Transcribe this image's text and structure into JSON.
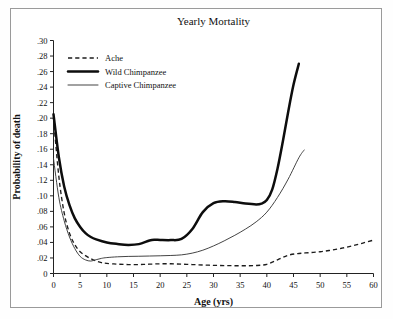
{
  "figure": {
    "title": "Yearly Mortality",
    "frame_color": "#9a9a9a",
    "background": "#ffffff"
  },
  "chart_data": {
    "type": "line",
    "title": "Yearly Mortality",
    "xlabel": "Age (yrs)",
    "ylabel": "Probability of death",
    "xlim": [
      0,
      60
    ],
    "ylim": [
      0,
      0.3
    ],
    "grid": false,
    "legend_position": "upper-left",
    "xticks": [
      0,
      5,
      10,
      15,
      20,
      25,
      30,
      35,
      40,
      45,
      50,
      55,
      60
    ],
    "xtick_labels": [
      "0",
      "5",
      "10",
      "15",
      "20",
      "25",
      "30",
      "35",
      "40",
      "45",
      "50",
      "55",
      "60"
    ],
    "yticks": [
      0,
      0.02,
      0.04,
      0.06,
      0.08,
      0.1,
      0.12,
      0.14,
      0.16,
      0.18,
      0.2,
      0.22,
      0.24,
      0.26,
      0.28,
      0.3
    ],
    "ytick_labels": [
      "0",
      ".02",
      ".04",
      ".06",
      ".08",
      ".10",
      ".12",
      ".14",
      ".16",
      ".18",
      ".20",
      ".22",
      ".24",
      ".26",
      ".28",
      ".30"
    ],
    "series": [
      {
        "name": "Ache",
        "style": "dashed",
        "color": "#1c1c1c",
        "width": 1.35,
        "x": [
          0,
          1,
          2,
          3,
          4,
          5,
          6,
          7,
          8,
          9,
          10,
          12,
          14,
          16,
          18,
          20,
          22,
          24,
          26,
          28,
          30,
          32,
          34,
          36,
          38,
          40,
          42,
          44,
          46,
          48,
          50,
          52,
          54,
          56,
          58,
          60
        ],
        "y": [
          0.2,
          0.125,
          0.078,
          0.052,
          0.037,
          0.028,
          0.023,
          0.019,
          0.016,
          0.014,
          0.013,
          0.012,
          0.0115,
          0.0115,
          0.012,
          0.0125,
          0.0125,
          0.012,
          0.0115,
          0.011,
          0.0105,
          0.0102,
          0.01,
          0.01,
          0.0103,
          0.0118,
          0.0175,
          0.0235,
          0.0258,
          0.0268,
          0.028,
          0.03,
          0.0325,
          0.0355,
          0.0392,
          0.043
        ]
      },
      {
        "name": "Wild Chimpanzee",
        "style": "solid-thick",
        "color": "#0d0d0d",
        "width": 2.5,
        "x": [
          0,
          1,
          2,
          3,
          4,
          5,
          6,
          7,
          8,
          10,
          12,
          14,
          16,
          18,
          19,
          20,
          22,
          24,
          26,
          28,
          30,
          32,
          34,
          36,
          38,
          39,
          40,
          41,
          42,
          43,
          44,
          45,
          46
        ],
        "y": [
          0.205,
          0.15,
          0.112,
          0.088,
          0.071,
          0.06,
          0.052,
          0.047,
          0.044,
          0.04,
          0.038,
          0.0368,
          0.0378,
          0.0425,
          0.0435,
          0.0432,
          0.043,
          0.0445,
          0.057,
          0.079,
          0.0905,
          0.093,
          0.092,
          0.09,
          0.089,
          0.09,
          0.0945,
          0.108,
          0.135,
          0.17,
          0.208,
          0.243,
          0.27
        ]
      },
      {
        "name": "Captive Chimpanzee",
        "style": "solid-thin",
        "color": "#3a3a3a",
        "width": 0.95,
        "x": [
          0,
          1,
          2,
          3,
          4,
          5,
          6,
          7,
          8,
          9,
          10,
          12,
          14,
          16,
          18,
          20,
          22,
          24,
          26,
          28,
          30,
          32,
          34,
          36,
          38,
          40,
          42,
          44,
          46,
          47
        ],
        "y": [
          0.148,
          0.098,
          0.068,
          0.047,
          0.032,
          0.022,
          0.0175,
          0.016,
          0.0178,
          0.0195,
          0.0205,
          0.0215,
          0.022,
          0.0222,
          0.0225,
          0.0228,
          0.0232,
          0.024,
          0.0262,
          0.03,
          0.0355,
          0.042,
          0.0492,
          0.0572,
          0.0665,
          0.079,
          0.098,
          0.1215,
          0.149,
          0.159
        ]
      }
    ]
  },
  "legend": {
    "items": [
      {
        "label": "Ache",
        "style": "dashed"
      },
      {
        "label": "Wild Chimpanzee",
        "style": "solid-thick"
      },
      {
        "label": "Captive Chimpanzee",
        "style": "solid-thin"
      }
    ]
  }
}
